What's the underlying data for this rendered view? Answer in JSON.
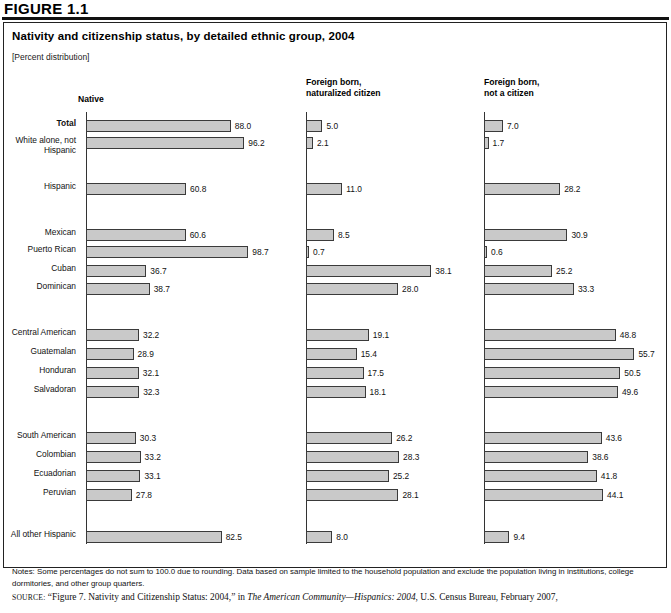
{
  "figure": {
    "tag": "FIGURE 1.1",
    "title": "Nativity and citizenship status, by detailed ethnic group, 2004",
    "subtitle": "[Percent distribution]"
  },
  "columns": [
    {
      "key": "native",
      "label": "Native"
    },
    {
      "key": "nat",
      "label": "Foreign born,\nnaturalized citizen"
    },
    {
      "key": "noncit",
      "label": "Foreign born,\nnot a citizen"
    }
  ],
  "notes": {
    "label": "Notes:",
    "text": "Notes: Some percentages do not sum to 100.0 due to rounding. Data based on sample limited to the household population and exclude the population living in institutions, college dormitories, and other group quarters."
  },
  "source": {
    "label": "SOURCE:",
    "quoted": "“Figure 7. Nativity and Citizenship Status: 2004,” in",
    "italic": "The American Community—Hispanics: 2004",
    "tail": ", U.S. Census Bureau, February 2007,"
  },
  "chart_data": {
    "type": "bar",
    "title": "Nativity and citizenship status, by detailed ethnic group, 2004",
    "subtitle": "[Percent distribution]",
    "xlabel": "",
    "ylabel": "",
    "orientation": "horizontal",
    "grid": false,
    "legend": "none",
    "panels": [
      "Native",
      "Foreign born, naturalized citizen",
      "Foreign born, not a citizen"
    ],
    "categories": [
      "Total",
      "White alone, not\nHispanic",
      "Hispanic",
      "Mexican",
      "Puerto Rican",
      "Cuban",
      "Dominican",
      "Central American",
      "Guatemalan",
      "Honduran",
      "Salvadoran",
      "South American",
      "Colombian",
      "Ecuadorian",
      "Peruvian",
      "All other Hispanic"
    ],
    "series": [
      {
        "name": "Native",
        "values": [
          88.0,
          96.2,
          60.8,
          60.6,
          98.7,
          36.7,
          38.7,
          32.2,
          28.9,
          32.1,
          32.3,
          30.3,
          33.2,
          33.1,
          27.8,
          82.5
        ]
      },
      {
        "name": "Foreign born, naturalized citizen",
        "values": [
          5.0,
          2.1,
          11.0,
          8.5,
          0.7,
          38.1,
          28.0,
          19.1,
          15.4,
          17.5,
          18.1,
          26.2,
          28.3,
          25.2,
          28.1,
          8.0
        ]
      },
      {
        "name": "Foreign born, not a citizen",
        "values": [
          7.0,
          1.7,
          28.2,
          30.9,
          0.6,
          25.2,
          33.3,
          48.8,
          55.7,
          50.5,
          49.6,
          43.6,
          38.6,
          41.8,
          44.1,
          9.4
        ]
      }
    ],
    "labels": [
      {
        "name": "Total",
        "bold": true,
        "native": "88.0",
        "nat": "5.0",
        "noncit": "7.0"
      },
      {
        "name": "White alone, not\nHispanic",
        "bold": false,
        "native": "96.2",
        "nat": "2.1",
        "noncit": "1.7"
      },
      {
        "name": "Hispanic",
        "bold": false,
        "native": "60.8",
        "nat": "11.0",
        "noncit": "28.2"
      },
      {
        "name": "Mexican",
        "bold": false,
        "native": "60.6",
        "nat": "8.5",
        "noncit": "30.9"
      },
      {
        "name": "Puerto Rican",
        "bold": false,
        "native": "98.7",
        "nat": "0.7",
        "noncit": "0.6"
      },
      {
        "name": "Cuban",
        "bold": false,
        "native": "36.7",
        "nat": "38.1",
        "noncit": "25.2"
      },
      {
        "name": "Dominican",
        "bold": false,
        "native": "38.7",
        "nat": "28.0",
        "noncit": "33.3"
      },
      {
        "name": "Central American",
        "bold": false,
        "native": "32.2",
        "nat": "19.1",
        "noncit": "48.8"
      },
      {
        "name": "Guatemalan",
        "bold": false,
        "native": "28.9",
        "nat": "15.4",
        "noncit": "55.7"
      },
      {
        "name": "Honduran",
        "bold": false,
        "native": "32.1",
        "nat": "17.5",
        "noncit": "50.5"
      },
      {
        "name": "Salvadoran",
        "bold": false,
        "native": "32.3",
        "nat": "18.1",
        "noncit": "49.6"
      },
      {
        "name": "South American",
        "bold": false,
        "native": "30.3",
        "nat": "26.2",
        "noncit": "43.6"
      },
      {
        "name": "Colombian",
        "bold": false,
        "native": "33.2",
        "nat": "28.3",
        "noncit": "38.6"
      },
      {
        "name": "Ecuadorian",
        "bold": false,
        "native": "33.1",
        "nat": "25.2",
        "noncit": "41.8"
      },
      {
        "name": "Peruvian",
        "bold": false,
        "native": "27.8",
        "nat": "28.1",
        "noncit": "44.1"
      },
      {
        "name": "All other Hispanic",
        "bold": false,
        "native": "82.5",
        "nat": "8.0",
        "noncit": "9.4"
      }
    ]
  },
  "layout": {
    "row_tops": [
      120,
      137,
      183,
      229,
      246,
      265,
      283,
      329,
      348,
      367,
      386,
      432,
      451,
      470,
      489,
      531
    ],
    "axes": [
      {
        "key": "native",
        "x": 86,
        "top": 112,
        "height": 432,
        "scale": 1.645
      },
      {
        "key": "nat",
        "x": 306,
        "top": 112,
        "height": 432,
        "scale": 3.29
      },
      {
        "key": "noncit",
        "x": 484,
        "top": 112,
        "height": 432,
        "scale": 2.7
      }
    ],
    "label_right": 80
  },
  "colors": {
    "bar_fill": "#c9c9c9",
    "bar_border": "#3a3a3a",
    "axis": "#333333",
    "text": "#111111",
    "panel_border": "#222222"
  }
}
